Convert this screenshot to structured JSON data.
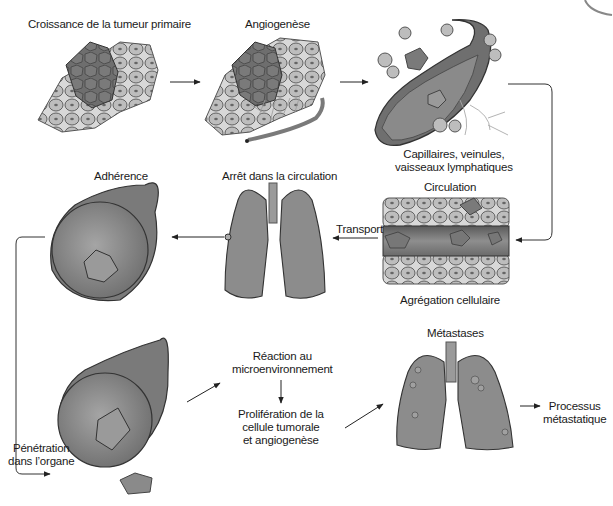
{
  "diagram": {
    "title": "Processus métastatique",
    "colors": {
      "background": "#ffffff",
      "tumor_dark": "#6e6e6e",
      "tissue_cell": "#bdbdbd",
      "vessel": "#8a8a8a",
      "organ": "#8c8c8c",
      "arrow": "#222222"
    },
    "stages": [
      {
        "id": "primary-growth",
        "label": "Croissance de la tumeur primaire"
      },
      {
        "id": "angiogenesis",
        "label": "Angiogenèse"
      },
      {
        "id": "vessels",
        "label_line1": "Capillaires, veinules,",
        "label_line2": "vaisseaux lymphatiques"
      },
      {
        "id": "circulation",
        "label": "Circulation"
      },
      {
        "id": "aggregation",
        "label": "Agrégation cellulaire"
      },
      {
        "id": "transport",
        "label": "Transport"
      },
      {
        "id": "arrest",
        "label": "Arrêt dans la circulation"
      },
      {
        "id": "adherence",
        "label": "Adhérence"
      },
      {
        "id": "penetration",
        "label_line1": "Pénétration",
        "label_line2": "dans l’organe"
      },
      {
        "id": "microenv",
        "label_line1": "Réaction au",
        "label_line2": "microenvironnement"
      },
      {
        "id": "proliferation",
        "label_line1": "Prolifération de la",
        "label_line2": "cellule tumorale",
        "label_line3": "et angiogenèse"
      },
      {
        "id": "metastases",
        "label": "Métastases"
      },
      {
        "id": "process",
        "label_line1": "Processus",
        "label_line2": "métastatique"
      }
    ]
  }
}
